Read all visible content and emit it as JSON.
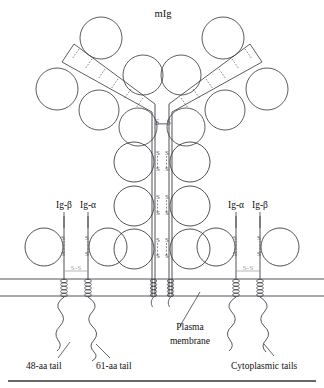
{
  "figure": {
    "title_label": "mIg",
    "subunit_labels": {
      "ig_beta_left": "Ig-β",
      "ig_alpha_left": "Ig-α",
      "ig_alpha_right": "Ig-α",
      "ig_beta_right": "Ig-β"
    },
    "annotations": {
      "plasma_membrane_line1": "Plasma",
      "plasma_membrane_line2": "membrane",
      "tail_48": "48-aa tail",
      "tail_61": "61-aa tail",
      "cytoplasmic_tails": "Cytoplasmic tails"
    },
    "bond_labels": {
      "sulfur": "S",
      "hinge_bond": "S—S",
      "heterodimer_bond": "S–S"
    },
    "colors": {
      "ink": "#1a1a1a",
      "line": "#33333a",
      "faint": "#8a8a92",
      "background": "#ffffff"
    }
  }
}
